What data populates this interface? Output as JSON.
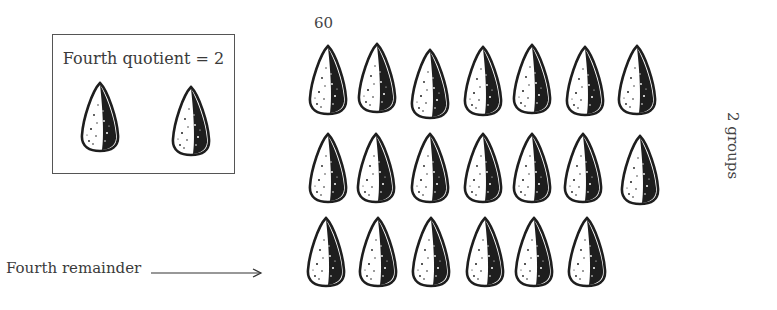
{
  "page_number": "60",
  "quotient_box": {
    "label": "Fourth quotient = 2",
    "seed_count": 2
  },
  "seed_grid": {
    "rows": [
      {
        "count": 7
      },
      {
        "count": 7
      },
      {
        "count": 6
      }
    ],
    "total_seeds": 20
  },
  "side_label": "2 groups",
  "remainder": {
    "label": "Fourth remainder",
    "arrow": "right-arrow-icon"
  },
  "colors": {
    "ink": "#222222",
    "text": "#3a3a3a",
    "background": "#ffffff"
  }
}
